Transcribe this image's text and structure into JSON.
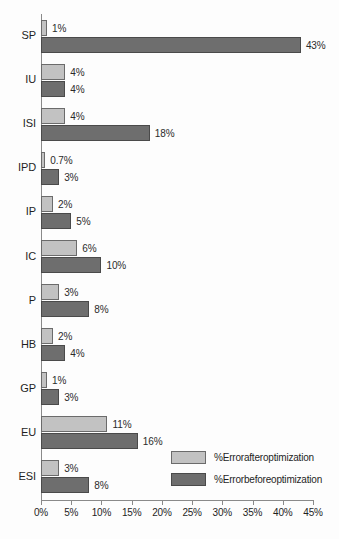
{
  "chart_data": {
    "type": "bar",
    "orientation": "horizontal",
    "title": "",
    "xlabel": "",
    "ylabel": "",
    "xlim": [
      0,
      45
    ],
    "xtick_labels": [
      "0%",
      "5%",
      "10%",
      "15%",
      "20%",
      "25%",
      "30%",
      "35%",
      "40%",
      "45%"
    ],
    "xtick_values": [
      0,
      5,
      10,
      15,
      20,
      25,
      30,
      35,
      40,
      45
    ],
    "grid": false,
    "legend_position": "bottom-right",
    "categories": [
      "SP",
      "IU",
      "ISI",
      "IPD",
      "IP",
      "IC",
      "P",
      "HB",
      "GP",
      "EU",
      "ESI"
    ],
    "series": [
      {
        "name": "%Errorafteroptimization",
        "color": "#c2c2c2",
        "values": [
          1,
          4,
          4,
          0.7,
          2,
          6,
          3,
          2,
          1,
          11,
          3
        ],
        "labels": [
          "1%",
          "4%",
          "4%",
          "0.7%",
          "2%",
          "6%",
          "3%",
          "2%",
          "1%",
          "11%",
          "3%"
        ]
      },
      {
        "name": "%Errorbeforeoptimization",
        "color": "#6e6e6e",
        "values": [
          43,
          4,
          18,
          3,
          5,
          10,
          8,
          4,
          3,
          16,
          8
        ],
        "labels": [
          "43%",
          "4%",
          "18%",
          "3%",
          "5%",
          "10%",
          "8%",
          "4%",
          "3%",
          "16%",
          "8%"
        ]
      }
    ]
  },
  "legend": {
    "items": [
      {
        "label": "%Errorafteroptimization",
        "swatch": "after"
      },
      {
        "label": "%Errorbeforeoptimization",
        "swatch": "before"
      }
    ]
  }
}
